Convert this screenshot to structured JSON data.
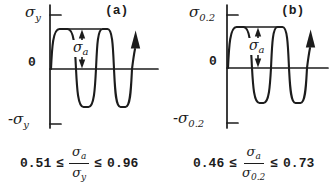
{
  "colors": {
    "background": "#ffffff",
    "ink": "#1c1c1c"
  },
  "panel_a": {
    "tag": "(a)",
    "axis_top_label": {
      "base": "σ",
      "sub": "y"
    },
    "zero_label": "0",
    "axis_bottom_label": {
      "base": "-σ",
      "sub": "y"
    },
    "amplitude_label": {
      "base": "σ",
      "sub": "a"
    },
    "formula": {
      "lower_bound": "0.51",
      "leq_left": "≤",
      "numerator": {
        "base": "σ",
        "sub": "a"
      },
      "denominator": {
        "base": "σ",
        "sub": "y"
      },
      "leq_right": "≤",
      "upper_bound": "0.96"
    }
  },
  "panel_b": {
    "tag": "(b)",
    "axis_top_label": {
      "base": "σ",
      "sub": "0.2"
    },
    "zero_label": "0",
    "axis_bottom_label": {
      "base": "-σ",
      "sub": "0.2"
    },
    "amplitude_label": {
      "base": "σ",
      "sub": "a"
    },
    "formula": {
      "lower_bound": "0.46",
      "leq_left": "≤",
      "numerator": {
        "base": "σ",
        "sub": "a"
      },
      "denominator": {
        "base": "σ",
        "sub": "0.2"
      },
      "leq_right": "≤",
      "upper_bound": "0.73"
    }
  }
}
